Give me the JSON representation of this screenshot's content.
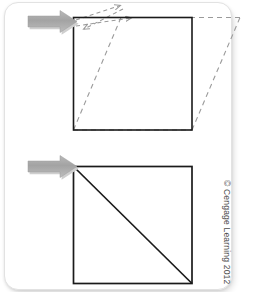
{
  "figure": {
    "credit": "© Cengage Learning 2012",
    "background_color": "#ffffff",
    "card_border_color": "#e2e2e2",
    "outline_color": "#1a1a1a",
    "dashed_color": "#9a9a9a",
    "arrow_fill": "#a8a8a8",
    "arrow_shadow": "#c9c9c9",
    "panels": [
      {
        "name": "top-panel",
        "description": "Square with dashed sheared parallelogram overlay and applied shear force arrow",
        "square": {
          "x": 73,
          "y": 17,
          "width": 119,
          "height": 113
        },
        "dashed_shapes": [
          {
            "name": "shear-top-extension",
            "type": "line",
            "points": "73,17 240,17"
          },
          {
            "name": "shear-left-diagonal",
            "type": "line",
            "points": "73,130 120,17"
          },
          {
            "name": "shear-right-diagonal",
            "type": "line",
            "points": "192,130 240,17"
          },
          {
            "name": "shear-bottom-edge",
            "type": "line",
            "points": "73,130 192,130"
          }
        ],
        "dashed_arrows": [
          {
            "name": "shear-direction-arrow-upper",
            "from": "78,20",
            "to": "122,5"
          },
          {
            "name": "shear-direction-arrow-lower",
            "from": "78,25",
            "to": "130,18"
          },
          {
            "name": "shear-return-arrow",
            "from": "122,8",
            "to": "84,28"
          }
        ],
        "force_arrow": {
          "name": "applied-force-arrow-top",
          "x": 27,
          "y": 12,
          "length": 48,
          "head": 18
        }
      },
      {
        "name": "bottom-panel",
        "description": "Square with diagonal from top-left corner to bottom-right corner and applied force arrow",
        "square": {
          "x": 73,
          "y": 166,
          "width": 119,
          "height": 117
        },
        "diagonal": {
          "name": "square-diagonal",
          "points": "73,166 192,283"
        },
        "force_arrow": {
          "name": "applied-force-arrow-bottom",
          "x": 27,
          "y": 160,
          "length": 48,
          "head": 18
        }
      }
    ]
  }
}
